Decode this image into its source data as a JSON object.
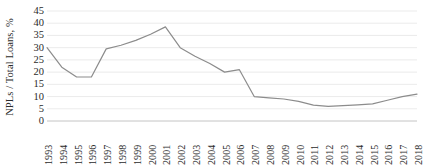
{
  "chart_data": {
    "type": "line",
    "title": "",
    "subtitle": "",
    "xlabel": "",
    "ylabel": "NPLs / Total Loans, %",
    "ylim": [
      0,
      45
    ],
    "ytick_step": 5,
    "yticks": [
      "0",
      "5",
      "10",
      "15",
      "20",
      "25",
      "30",
      "35",
      "40",
      "45"
    ],
    "grid": true,
    "legend": "none",
    "annotations": [],
    "categories": [
      "1993",
      "1994",
      "1995",
      "1996",
      "1997",
      "1998",
      "1999",
      "2000",
      "2001",
      "2002",
      "2003",
      "2004",
      "2005",
      "2006",
      "2007",
      "2008",
      "2009",
      "2010",
      "2011",
      "2012",
      "2013",
      "2014",
      "2015",
      "2016",
      "2017",
      "2018"
    ],
    "series": [
      {
        "name": "NPLs / Total Loans",
        "color": "#8c8c8c",
        "values": [
          30,
          22,
          18,
          18,
          29.5,
          31,
          33,
          35.5,
          38.5,
          30,
          26.5,
          23.5,
          20,
          21,
          10,
          9.5,
          9,
          8,
          6.5,
          6,
          6.3,
          6.6,
          7,
          8.5,
          10,
          11
        ]
      }
    ]
  },
  "axis": {
    "y_title": "NPLs / Total Loans, %"
  }
}
